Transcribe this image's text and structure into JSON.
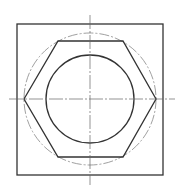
{
  "drawing": {
    "title": "Hexagon nut top view",
    "stroke_color": "#333333",
    "centerline_color": "#555555",
    "background": "#ffffff",
    "square": {
      "x": 17,
      "y": 24,
      "width": 146,
      "height": 151
    },
    "center": {
      "x": 90,
      "y": 99
    },
    "hexagon_points": "24,99 58,41 123,41 156,99 123,157 58,157",
    "inner_circle_radius": 44,
    "construction_circle_radius": 66,
    "horizontal_centerline": {
      "x1": 9,
      "x2": 175
    },
    "vertical_centerline": {
      "y1": 15,
      "y2": 185
    }
  }
}
